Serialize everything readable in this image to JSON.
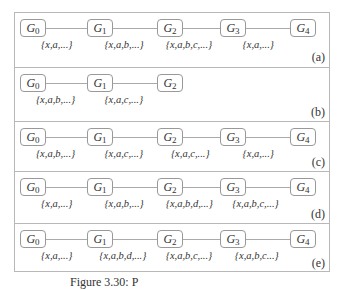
{
  "figure": {
    "caption": "Figure 3.30: P",
    "panels": [
      {
        "label": "(a)",
        "nodes": [
          {
            "name": "G",
            "sub": "0"
          },
          {
            "name": "G",
            "sub": "1"
          },
          {
            "name": "G",
            "sub": "2"
          },
          {
            "name": "G",
            "sub": "3"
          },
          {
            "name": "G",
            "sub": "4"
          }
        ],
        "edges": [
          "{x,a,...}",
          "{x,a,b,...}",
          "{x,a,b,c,...}",
          "{x,a,...}"
        ]
      },
      {
        "label": "(b)",
        "nodes": [
          {
            "name": "G",
            "sub": "0"
          },
          {
            "name": "G",
            "sub": "1"
          },
          {
            "name": "G",
            "sub": "2"
          }
        ],
        "edges": [
          "{x,a,b,...}",
          "{x,a,c,...}"
        ]
      },
      {
        "label": "(c)",
        "nodes": [
          {
            "name": "G",
            "sub": "0"
          },
          {
            "name": "G",
            "sub": "1"
          },
          {
            "name": "G",
            "sub": "2"
          },
          {
            "name": "G",
            "sub": "3"
          },
          {
            "name": "G",
            "sub": "4"
          }
        ],
        "edges": [
          "{x,a,b,...}",
          "{x,a,c,...}",
          "{x,a,c,...}",
          "{x,a,...}"
        ]
      },
      {
        "label": "(d)",
        "nodes": [
          {
            "name": "G",
            "sub": "0"
          },
          {
            "name": "G",
            "sub": "1"
          },
          {
            "name": "G",
            "sub": "2"
          },
          {
            "name": "G",
            "sub": "3"
          },
          {
            "name": "G",
            "sub": "4"
          }
        ],
        "edges": [
          "{x,a,...}",
          "{x,a,b,...}",
          "{x,a,b,d,...}",
          "{x,a,b,c,...}"
        ]
      },
      {
        "label": "(e)",
        "nodes": [
          {
            "name": "G",
            "sub": "0"
          },
          {
            "name": "G",
            "sub": "1"
          },
          {
            "name": "G",
            "sub": "2"
          },
          {
            "name": "G",
            "sub": "3"
          },
          {
            "name": "G",
            "sub": "4"
          }
        ],
        "edges": [
          "{x,a,...}",
          "{x,a,b,d,...}",
          "{x,a,b,c,...}",
          "{x,a,b,c...}"
        ]
      }
    ]
  }
}
